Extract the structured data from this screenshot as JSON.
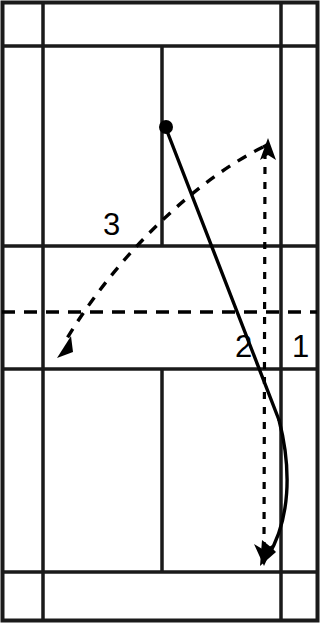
{
  "figure": {
    "court": {
      "name": "badminton-court",
      "surface_color": "#ffffff",
      "line_color": "#1a1a1a",
      "outer_boundary": {
        "x1": 2,
        "y1": 2,
        "x2": 317,
        "y2": 620
      },
      "side_lines_x": [
        43,
        281
      ],
      "long_service_lines_y": [
        46,
        572
      ],
      "short_service_lines_y": [
        246,
        369
      ],
      "centre_lines_x": [
        162
      ],
      "net_line": {
        "y": 312,
        "style": "dashed",
        "color": "#000000"
      }
    },
    "shuttle_origin": {
      "name": "hitting-point",
      "x": 165,
      "y": 127,
      "radius": 6,
      "color": "#000000"
    },
    "trajectories": [
      {
        "id": "1",
        "label": "1",
        "label_x": 293,
        "label_y": 357,
        "style": "solid",
        "description": "Steep straight smash from hitting point to rear court, shown with curved return arc",
        "color": "#000000"
      },
      {
        "id": "2",
        "label": "2",
        "label_x": 236,
        "label_y": 357,
        "style": "dotted",
        "description": "Vertical dotted reference line from net-height apex down to landing point",
        "color": "#000000"
      },
      {
        "id": "3",
        "label": "3",
        "label_x": 103,
        "label_y": 235,
        "style": "dashed",
        "description": "Crosscourt lifted clear arcing over the net to the far left corner",
        "color": "#000000"
      }
    ],
    "arrowheads": [
      {
        "name": "arrowhead-up-right",
        "x": 268,
        "y": 142,
        "direction": "up"
      },
      {
        "name": "arrowhead-down-left",
        "x": 56,
        "y": 356,
        "direction": "down-left"
      },
      {
        "name": "arrowhead-down-solid",
        "x": 265,
        "y": 562,
        "direction": "down-left"
      },
      {
        "name": "arrowhead-down-dotted",
        "x": 264,
        "y": 560,
        "direction": "down"
      }
    ]
  }
}
